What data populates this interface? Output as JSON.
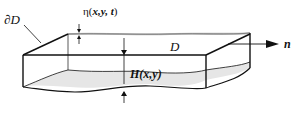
{
  "diagram": {
    "type": "3D fluid domain schematic",
    "labels": {
      "boundary": "∂D",
      "surface_elevation": "η(x,y,t)",
      "surface_elevation_parts": {
        "eta": "η(",
        "args": "x,y, t",
        "close": ")"
      },
      "domain": "D",
      "normal": "n",
      "depth": "H(x,y)"
    },
    "colors": {
      "stroke": "#111111",
      "bottom_fill": "#e6e6e6",
      "surface_shade": "#bdbdbd",
      "background": "#ffffff"
    }
  }
}
